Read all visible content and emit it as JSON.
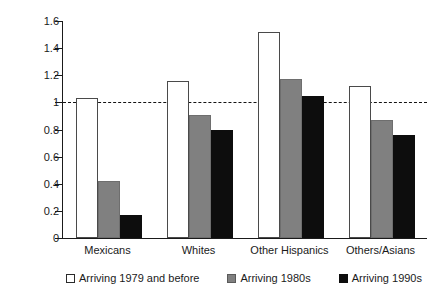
{
  "chart_data": {
    "type": "bar",
    "title": "",
    "subtitle": "",
    "xlabel": "",
    "ylabel": "",
    "categories": [
      "Mexicans",
      "Whites",
      "Other Hispanics",
      "Others/Asians"
    ],
    "series": [
      {
        "name": "Arriving 1979 and before",
        "color": "#ffffff",
        "values": [
          1.03,
          1.16,
          1.52,
          1.12
        ]
      },
      {
        "name": "Arriving 1980s",
        "color": "#808080",
        "values": [
          0.42,
          0.91,
          1.17,
          0.87
        ]
      },
      {
        "name": "Arriving 1990s",
        "color": "#0d0d0d",
        "values": [
          0.17,
          0.8,
          1.05,
          0.76
        ]
      }
    ],
    "ylim": [
      0,
      1.6
    ],
    "ytick_labels": [
      "0",
      "0.2",
      "0.4",
      "0.6",
      "0.8",
      "1",
      "1.2",
      "1.4",
      "1.6"
    ],
    "ytick_values": [
      0,
      0.2,
      0.4,
      0.6,
      0.8,
      1.0,
      1.2,
      1.4,
      1.6
    ],
    "grid": false,
    "legend_position": "bottom",
    "reference_line": {
      "value": 1.0,
      "style": "dashed",
      "color": "#141414"
    }
  },
  "legend": {
    "items": [
      {
        "label": "Arriving 1979 and before",
        "swatch": "white-square-icon"
      },
      {
        "label": "Arriving 1980s",
        "swatch": "gray-square-icon"
      },
      {
        "label": "Arriving 1990s",
        "swatch": "black-square-icon"
      }
    ]
  }
}
